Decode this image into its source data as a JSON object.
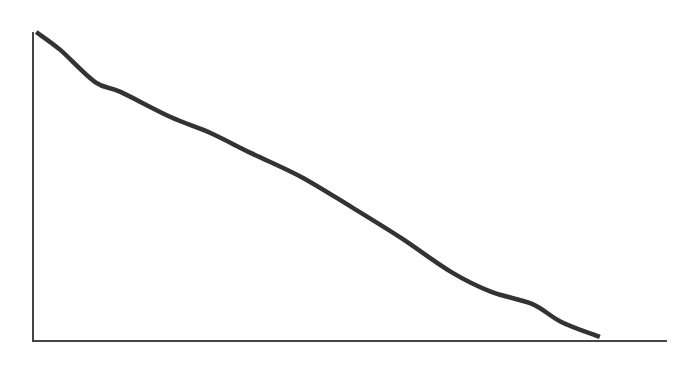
{
  "chart_data": {
    "type": "line",
    "title": "",
    "xlabel": "",
    "ylabel": "",
    "grid": false,
    "legend": null,
    "tick_labels": {
      "x": [],
      "y": []
    },
    "xlim": [
      0,
      1
    ],
    "ylim": [
      0,
      1
    ],
    "series": [
      {
        "name": "",
        "color": "#333333",
        "x": [
          0.005,
          0.043,
          0.098,
          0.138,
          0.217,
          0.28,
          0.344,
          0.423,
          0.502,
          0.581,
          0.66,
          0.723,
          0.787,
          0.834,
          0.894
        ],
        "values": [
          1.0,
          0.942,
          0.838,
          0.806,
          0.725,
          0.673,
          0.608,
          0.531,
          0.434,
          0.333,
          0.223,
          0.159,
          0.12,
          0.061,
          0.013
        ]
      }
    ],
    "axis_color": "#444444"
  },
  "layout": {
    "origin_px": [
      33,
      341
    ],
    "x_axis_end_px": 667,
    "y_axis_top_px": 32
  }
}
